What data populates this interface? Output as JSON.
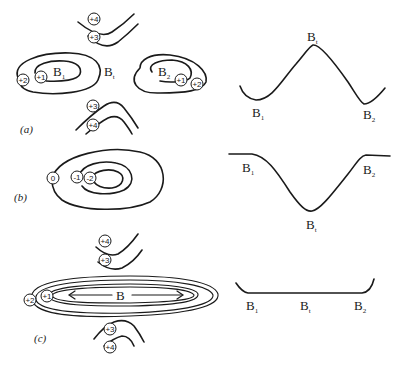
{
  "figure": {
    "panels": [
      {
        "id": "a",
        "label": "(a)",
        "contour_labels": [
          "+4",
          "+3",
          "+2",
          "+1",
          "+1",
          "+2",
          "+3",
          "+4"
        ],
        "points": {
          "left_basin": "B",
          "left_sub": "1",
          "saddle": "B",
          "saddle_sub": "t",
          "right_basin": "B",
          "right_sub": "2"
        },
        "profile": {
          "shape": "hill",
          "labels": {
            "B1": "B",
            "B1_sub": "1",
            "Bt": "B",
            "Bt_sub": "t",
            "B2": "B",
            "B2_sub": "2"
          }
        }
      },
      {
        "id": "b",
        "label": "(b)",
        "contour_labels": [
          "0",
          "-1",
          "-2"
        ],
        "profile": {
          "shape": "valley",
          "labels": {
            "B1": "B",
            "B1_sub": "1",
            "Bt": "B",
            "Bt_sub": "t",
            "B2": "B",
            "B2_sub": "2"
          }
        }
      },
      {
        "id": "c",
        "label": "(c)",
        "contour_labels": [
          "+4",
          "+3",
          "+2",
          "+1",
          "+3",
          "+4"
        ],
        "basin_label": "B",
        "profile": {
          "shape": "flat",
          "labels": {
            "B1": "B",
            "B1_sub": "1",
            "Bt": "B",
            "Bt_sub": "t",
            "B2": "B",
            "B2_sub": "2"
          }
        }
      }
    ]
  }
}
